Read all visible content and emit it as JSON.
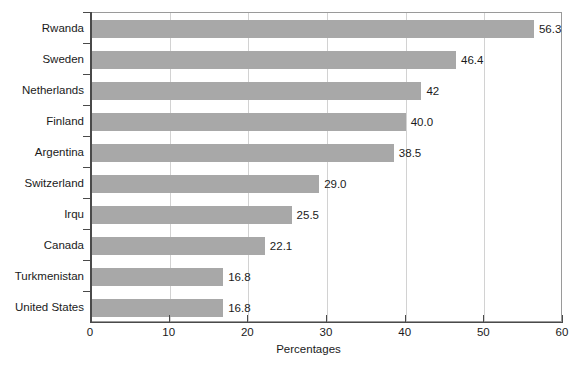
{
  "chart_data": {
    "type": "bar",
    "orientation": "horizontal",
    "title": "",
    "xlabel": "Percentages",
    "ylabel": "",
    "xlim": [
      0,
      60
    ],
    "xticks": [
      0,
      10,
      20,
      30,
      40,
      50,
      60
    ],
    "xtick_labels": [
      "0",
      "10",
      "20",
      "30",
      "40",
      "50",
      "60"
    ],
    "grid": true,
    "legend": false,
    "bar_color": "#a8a8a8",
    "categories": [
      "Rwanda",
      "Sweden",
      "Netherlands",
      "Finland",
      "Argentina",
      "Switzerland",
      "Irqu",
      "Canada",
      "Turkmenistan",
      "United States"
    ],
    "values": [
      56.3,
      46.4,
      42,
      40.0,
      38.5,
      29.0,
      25.5,
      22.1,
      16.8,
      16.8
    ],
    "data_labels": [
      "56.3",
      "46.4",
      "42",
      "40.0",
      "38.5",
      "29.0",
      "25.5",
      "22.1",
      "16.8",
      "16.8"
    ]
  }
}
